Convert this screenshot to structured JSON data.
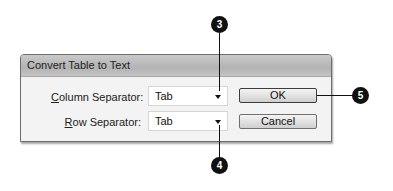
{
  "dialog": {
    "title": "Convert Table to Text",
    "column_separator": {
      "label_mnemonic": "C",
      "label_rest": "olumn Separator:",
      "value": "Tab"
    },
    "row_separator": {
      "label_mnemonic": "R",
      "label_rest": "ow Separator:",
      "value": "Tab"
    },
    "buttons": {
      "ok": "OK",
      "cancel": "Cancel"
    }
  },
  "callouts": [
    {
      "number": "3",
      "target": "column-separator-dropdown"
    },
    {
      "number": "4",
      "target": "row-separator-dropdown"
    },
    {
      "number": "5",
      "target": "ok-button"
    }
  ]
}
